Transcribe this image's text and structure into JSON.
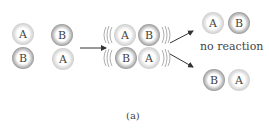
{
  "diagram": {
    "reactants": [
      {
        "label": "A",
        "shade": "light"
      },
      {
        "label": "B",
        "shade": "dark"
      },
      {
        "label": "B",
        "shade": "dark"
      },
      {
        "label": "A",
        "shade": "light"
      }
    ],
    "intermediate": [
      {
        "label": "A",
        "shade": "light"
      },
      {
        "label": "B",
        "shade": "dark"
      },
      {
        "label": "B",
        "shade": "dark"
      },
      {
        "label": "A",
        "shade": "light"
      }
    ],
    "outcome_top": [
      {
        "label": "A",
        "shade": "light"
      },
      {
        "label": "B",
        "shade": "dark"
      }
    ],
    "outcome_top_label": "no reaction",
    "outcome_bottom": [
      {
        "label": "B",
        "shade": "dark"
      },
      {
        "label": "A",
        "shade": "light"
      }
    ],
    "caption": "(a)"
  }
}
